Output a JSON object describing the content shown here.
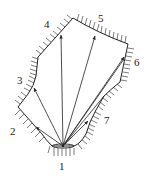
{
  "diagram": {
    "source_label": "1",
    "labels": [
      {
        "id": "1",
        "x": 62,
        "y": 170
      },
      {
        "id": "2",
        "x": 14,
        "y": 133
      },
      {
        "id": "3",
        "x": 17,
        "y": 84
      },
      {
        "id": "4",
        "x": 45,
        "y": 27
      },
      {
        "id": "5",
        "x": 100,
        "y": 22
      },
      {
        "id": "6",
        "x": 135,
        "y": 65
      },
      {
        "id": "7",
        "x": 104,
        "y": 123
      }
    ],
    "colors": {
      "line": "#222222",
      "background": "#ffffff"
    }
  }
}
